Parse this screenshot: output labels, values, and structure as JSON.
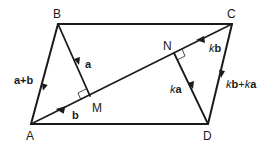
{
  "diagram": {
    "type": "parallelogram vector diagram",
    "points": {
      "A": {
        "label": "A",
        "x": 31,
        "y": 124
      },
      "B": {
        "label": "B",
        "x": 58,
        "y": 24
      },
      "C": {
        "label": "C",
        "x": 232,
        "y": 24
      },
      "D": {
        "label": "D",
        "x": 208,
        "y": 124
      },
      "M": {
        "label": "M",
        "x": 90,
        "y": 96
      },
      "N": {
        "label": "N",
        "x": 174,
        "y": 53
      }
    },
    "vectors": {
      "BA": {
        "label": "a+b"
      },
      "BM": {
        "label": "a"
      },
      "MA": {
        "label": "b"
      },
      "CN": {
        "label_k": "k",
        "label_v": "b"
      },
      "ND": {
        "label_k": "k",
        "label_v": "a"
      },
      "CD": {
        "label": "kb+ka",
        "part1_k": "k",
        "part1_v": "b",
        "plus": "+",
        "part2_k": "k",
        "part2_v": "a"
      }
    },
    "stroke_color": "#1a1a1a"
  }
}
